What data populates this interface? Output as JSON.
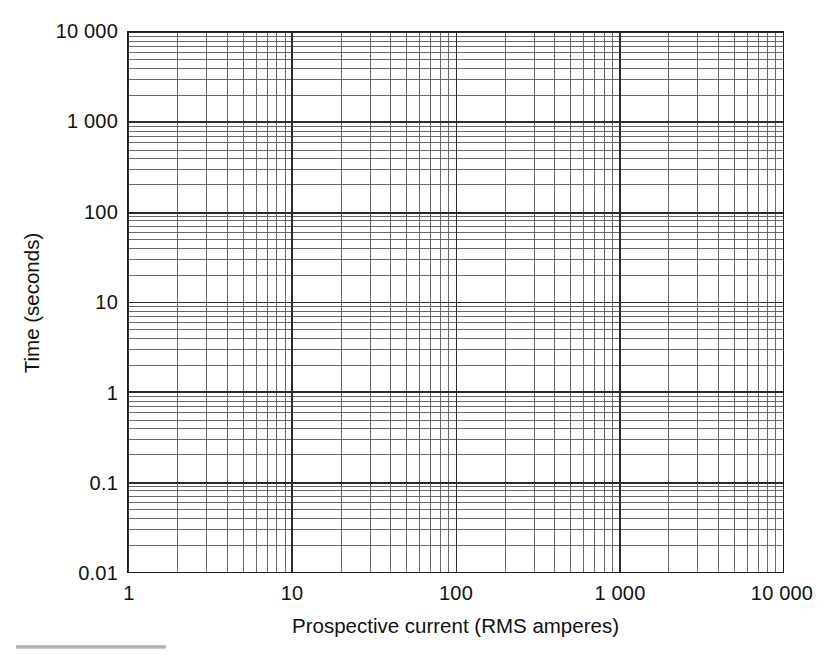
{
  "chart_data": {
    "type": "line",
    "title": "",
    "subtitle": "",
    "xlabel": "Prospective current (RMS amperes)",
    "ylabel": "Time (seconds)",
    "xscale": "log",
    "yscale": "log",
    "xlim": [
      1,
      10000
    ],
    "ylim": [
      0.01,
      10000
    ],
    "grid": true,
    "grid_minor": true,
    "legend": null,
    "annotations": [],
    "series": [],
    "x_major_ticks": [
      {
        "value": 1,
        "label": "1"
      },
      {
        "value": 10,
        "label": "10"
      },
      {
        "value": 100,
        "label": "100"
      },
      {
        "value": 1000,
        "label": "1 000"
      },
      {
        "value": 10000,
        "label": "10 000"
      }
    ],
    "y_major_ticks": [
      {
        "value": 10000,
        "label": "10 000"
      },
      {
        "value": 1000,
        "label": "1 000"
      },
      {
        "value": 100,
        "label": "100"
      },
      {
        "value": 10,
        "label": "10"
      },
      {
        "value": 1,
        "label": "1"
      },
      {
        "value": 0.1,
        "label": "0.1"
      },
      {
        "value": 0.01,
        "label": "0.01"
      }
    ],
    "minor_tick_multipliers": [
      2,
      3,
      4,
      5,
      6,
      7,
      8,
      9
    ],
    "colors": {
      "background": "#ffffff",
      "frame": "#1a1a1a",
      "major_grid": "#2b2b2b",
      "minor_grid": "#585858",
      "text": "#111111"
    }
  },
  "axis": {
    "x_title": "Prospective current (RMS amperes)",
    "y_title": "Time (seconds)"
  },
  "xticks": {
    "t0": "1",
    "t1": "10",
    "t2": "100",
    "t3": "1 000",
    "t4": "10 000"
  },
  "yticks": {
    "t0": "10 000",
    "t1": "1 000",
    "t2": "100",
    "t3": "10",
    "t4": "1",
    "t5": "0.1",
    "t6": "0.01"
  }
}
